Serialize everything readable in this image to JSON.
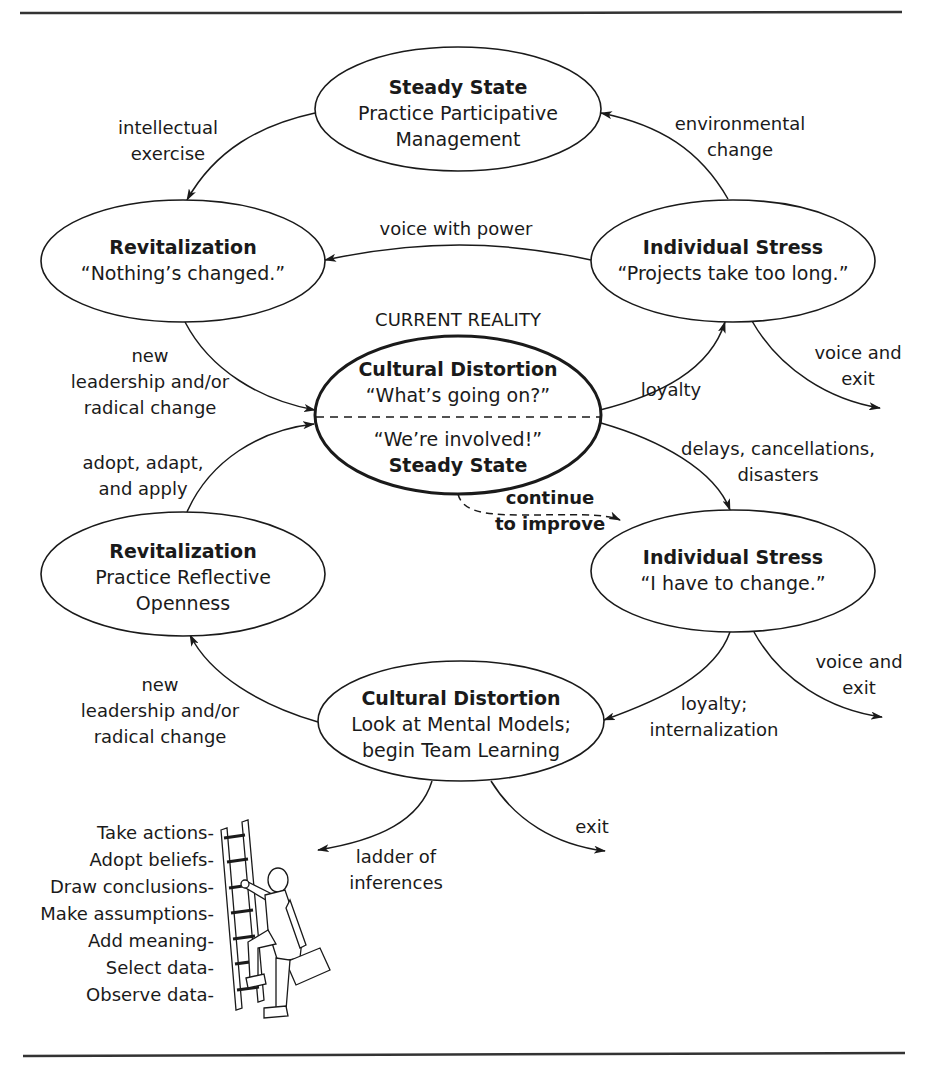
{
  "diagram": {
    "caption": "CURRENT REALITY",
    "nodes": {
      "steady_top": {
        "title": "Steady State",
        "line1": "Practice Participative",
        "line2": "Management"
      },
      "revital_top": {
        "title": "Revitalization",
        "line1": "“Nothing’s changed.”"
      },
      "stress_top": {
        "title": "Individual Stress",
        "line1": "“Projects take too long.”"
      },
      "center": {
        "title": "Cultural Distortion",
        "upper_quote": "“What’s going on?”",
        "lower_quote": "“We’re involved!”",
        "lower_title": "Steady State"
      },
      "revital_bottom": {
        "title": "Revitalization",
        "line1": "Practice Reflective",
        "line2": "Openness"
      },
      "stress_bottom": {
        "title": "Individual Stress",
        "line1": "“I have to change.”"
      },
      "distortion_bottom": {
        "title": "Cultural Distortion",
        "line1": "Look at Mental Models;",
        "line2": "begin Team Learning"
      }
    },
    "edges": {
      "intellectual_exercise": [
        "intellectual",
        "exercise"
      ],
      "environmental_change": [
        "environmental",
        "change"
      ],
      "voice_with_power": [
        "voice with power"
      ],
      "new_leadership_top": [
        "new",
        "leadership and/or",
        "radical change"
      ],
      "loyalty": [
        "loyalty"
      ],
      "voice_exit_top": [
        "voice and",
        "exit"
      ],
      "adopt_adapt_apply": [
        "adopt, adapt,",
        "and apply"
      ],
      "delays": [
        "delays, cancellations,",
        "disasters"
      ],
      "continue_improve": [
        "continue",
        "to improve"
      ],
      "voice_exit_bottom": [
        "voice and",
        "exit"
      ],
      "loyalty_internalization": [
        "loyalty;",
        "internalization"
      ],
      "new_leadership_bottom": [
        "new",
        "leadership and/or",
        "radical change"
      ],
      "exit": [
        "exit"
      ],
      "ladder_of_inferences": [
        "ladder of",
        "inferences"
      ]
    },
    "ladder_steps": [
      "Take actions-",
      "Adopt beliefs-",
      "Draw conclusions-",
      "Make assumptions-",
      "Add meaning-",
      "Select data-",
      "Observe data-"
    ]
  }
}
